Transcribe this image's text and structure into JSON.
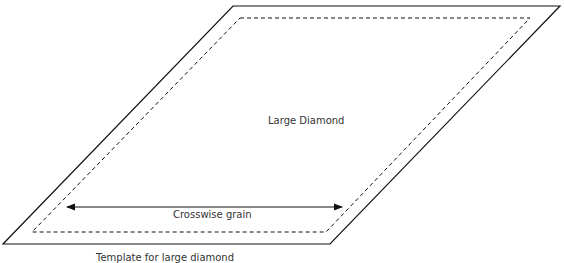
{
  "diagram": {
    "center_label": "Large Diamond",
    "arrow_label": "Crosswise grain",
    "caption": "Template for large diamond",
    "colors": {
      "stroke": "#111111",
      "text": "#333333",
      "background": "#ffffff"
    },
    "shapes": {
      "outer_parallelogram": {
        "points": [
          [
            233,
            6
          ],
          [
            560,
            6
          ],
          [
            330,
            244
          ],
          [
            3,
            244
          ]
        ],
        "style": "solid"
      },
      "inner_parallelogram": {
        "points": [
          [
            240,
            18
          ],
          [
            530,
            18
          ],
          [
            326,
            232
          ],
          [
            32,
            232
          ]
        ],
        "style": "dashed"
      },
      "grain_arrow": {
        "from": [
          67,
          207
        ],
        "to": [
          342,
          207
        ],
        "style": "double-headed"
      }
    }
  }
}
